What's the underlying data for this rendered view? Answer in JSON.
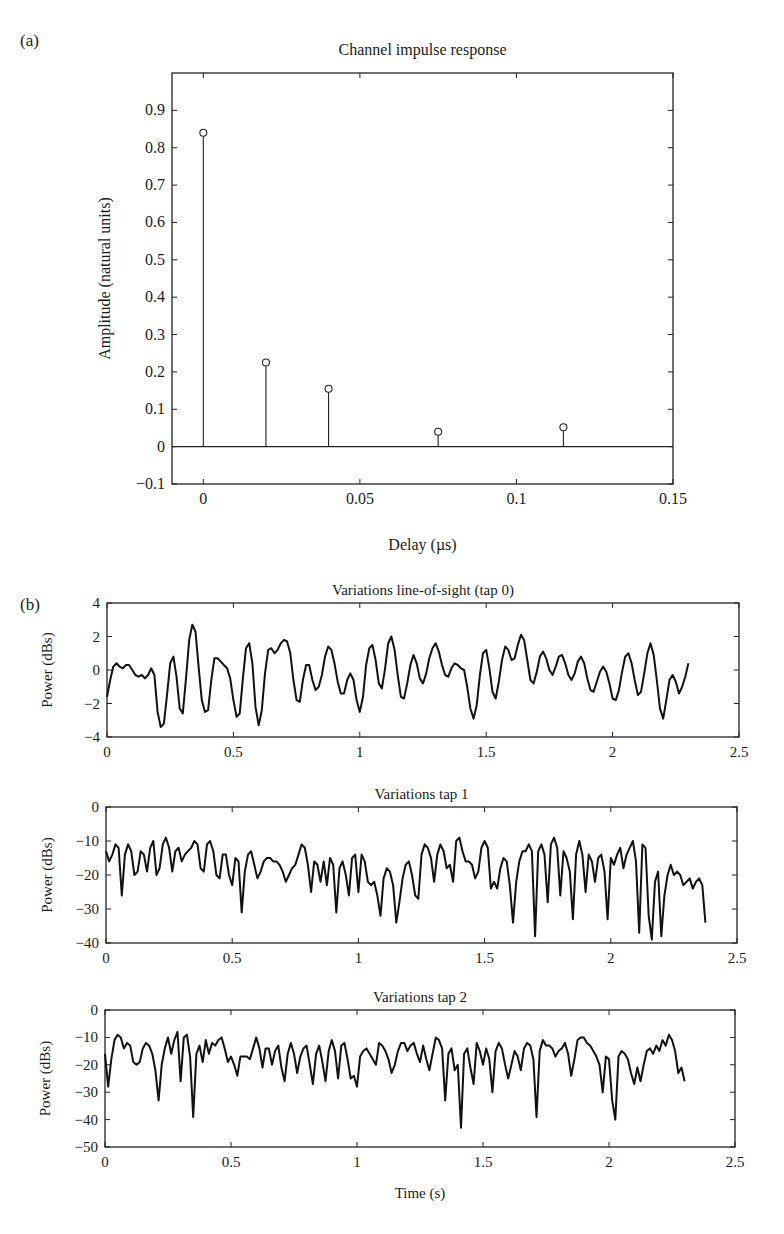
{
  "figure": {
    "panel_a_label": "(a)",
    "panel_b_label": "(b)"
  },
  "chart_data": [
    {
      "id": "a",
      "type": "stem",
      "title": "Channel impulse response",
      "xlabel": "Delay (µs)",
      "ylabel": "Amplitude (natural units)",
      "xlim": [
        -0.01,
        0.15
      ],
      "ylim": [
        -0.1,
        1.0
      ],
      "xticks": [
        0,
        0.05,
        0.1,
        0.15
      ],
      "xtick_labels": [
        "0",
        "0.05",
        "0.1",
        "0.15"
      ],
      "yticks": [
        -0.1,
        0,
        0.1,
        0.2,
        0.3,
        0.4,
        0.5,
        0.6,
        0.7,
        0.8,
        0.9
      ],
      "ytick_labels": [
        "−0.1",
        "0",
        "0.1",
        "0.2",
        "0.3",
        "0.4",
        "0.5",
        "0.6",
        "0.7",
        "0.8",
        "0.9"
      ],
      "x": [
        0,
        0.02,
        0.04,
        0.075,
        0.115
      ],
      "values": [
        0.84,
        0.225,
        0.155,
        0.04,
        0.052
      ],
      "grid": false,
      "zero_line": true
    },
    {
      "id": "b1",
      "type": "line",
      "title": "Variations line-of-sight (tap 0)",
      "xlabel": "",
      "ylabel": "Power (dBs)",
      "xlim": [
        0,
        2.5
      ],
      "ylim": [
        -4,
        4
      ],
      "xticks": [
        0,
        0.5,
        1,
        1.5,
        2,
        2.5
      ],
      "xtick_labels": [
        "0",
        "0.5",
        "1",
        "1.5",
        "2",
        "2.5"
      ],
      "yticks": [
        -4,
        -2,
        0,
        2,
        4
      ],
      "ytick_labels": [
        "−4",
        "−2",
        "0",
        "2",
        "4"
      ],
      "grid": false,
      "x_step": 0.0125,
      "values": [
        -1.6,
        -0.6,
        0.2,
        0.4,
        0.2,
        0.1,
        0.3,
        0.3,
        0.0,
        -0.3,
        -0.4,
        -0.3,
        -0.5,
        -0.3,
        0.1,
        -0.3,
        -2.5,
        -3.4,
        -3.2,
        -1.5,
        0.4,
        0.8,
        -0.4,
        -2.3,
        -2.6,
        -0.5,
        1.8,
        2.7,
        2.3,
        0.2,
        -1.8,
        -2.5,
        -2.4,
        -0.6,
        0.7,
        0.7,
        0.5,
        0.3,
        0.1,
        -0.5,
        -1.8,
        -2.8,
        -2.6,
        -0.5,
        1.3,
        1.6,
        0.4,
        -2.2,
        -3.3,
        -2.4,
        -0.2,
        1.2,
        1.3,
        1.0,
        1.2,
        1.6,
        1.8,
        1.7,
        1.0,
        -0.6,
        -1.8,
        -1.9,
        -0.6,
        0.3,
        0.3,
        -0.6,
        -1.2,
        -1.0,
        -0.3,
        0.8,
        1.4,
        1.2,
        0.4,
        -0.7,
        -1.4,
        -1.4,
        -0.6,
        -0.2,
        -0.6,
        -1.8,
        -2.5,
        -1.6,
        0.3,
        1.3,
        1.5,
        0.6,
        -0.8,
        -1.1,
        0.1,
        1.6,
        2.0,
        1.2,
        -0.3,
        -1.6,
        -1.7,
        -0.8,
        0.3,
        0.9,
        0.4,
        -0.5,
        -0.8,
        -0.2,
        0.7,
        1.3,
        1.6,
        1.1,
        0.3,
        -0.3,
        -0.4,
        0.1,
        0.4,
        0.3,
        0.1,
        0.0,
        -1.0,
        -2.3,
        -2.9,
        -2.1,
        -0.3,
        1.0,
        1.2,
        0.1,
        -1.3,
        -1.7,
        -0.7,
        0.6,
        1.4,
        1.2,
        0.6,
        0.7,
        1.5,
        2.1,
        1.8,
        0.6,
        -0.6,
        -0.8,
        -0.1,
        0.8,
        1.1,
        0.7,
        0.0,
        -0.3,
        0.2,
        0.8,
        0.9,
        0.4,
        -0.3,
        -0.6,
        -0.2,
        0.5,
        0.8,
        0.4,
        -0.5,
        -1.2,
        -1.3,
        -0.7,
        -0.1,
        0.2,
        -0.1,
        -0.8,
        -1.7,
        -1.8,
        -1.2,
        -0.1,
        0.8,
        1.0,
        0.4,
        -0.6,
        -1.5,
        -1.3,
        -0.2,
        1.0,
        1.6,
        0.9,
        -0.6,
        -2.3,
        -2.9,
        -1.8,
        -0.6,
        -0.3,
        -0.7,
        -1.4,
        -1.0,
        -0.4,
        0.4
      ]
    },
    {
      "id": "b2",
      "type": "line",
      "title": "Variations tap 1",
      "xlabel": "",
      "ylabel": "Power (dBs)",
      "xlim": [
        0,
        2.5
      ],
      "ylim": [
        -40,
        0
      ],
      "xticks": [
        0,
        0.5,
        1,
        1.5,
        2,
        2.5
      ],
      "xtick_labels": [
        "0",
        "0.5",
        "1",
        "1.5",
        "2",
        "2.5"
      ],
      "yticks": [
        -40,
        -30,
        -20,
        -10,
        0
      ],
      "ytick_labels": [
        "−40",
        "−30",
        "−20",
        "−10",
        "0"
      ],
      "grid": false,
      "x_step": 0.0125,
      "values": [
        -13,
        -16,
        -14,
        -11,
        -12,
        -26,
        -14,
        -11,
        -13,
        -20,
        -19,
        -13,
        -14,
        -19,
        -12,
        -10,
        -20,
        -18,
        -11,
        -9,
        -12,
        -19,
        -13,
        -12,
        -16,
        -14,
        -13,
        -12,
        -10,
        -11,
        -18,
        -19,
        -11,
        -10,
        -13,
        -20,
        -21,
        -14,
        -14,
        -20,
        -23,
        -15,
        -16,
        -31,
        -19,
        -14,
        -13,
        -17,
        -21,
        -19,
        -16,
        -15,
        -15,
        -16,
        -16,
        -17,
        -19,
        -22,
        -20,
        -18,
        -17,
        -14,
        -11,
        -12,
        -17,
        -25,
        -16,
        -17,
        -22,
        -16,
        -23,
        -15,
        -17,
        -31,
        -18,
        -16,
        -20,
        -26,
        -15,
        -14,
        -25,
        -14,
        -16,
        -22,
        -23,
        -22,
        -26,
        -32,
        -21,
        -18,
        -19,
        -23,
        -34,
        -28,
        -21,
        -17,
        -16,
        -20,
        -26,
        -27,
        -14,
        -11,
        -12,
        -15,
        -22,
        -14,
        -11,
        -13,
        -18,
        -17,
        -22,
        -10,
        -9,
        -13,
        -16,
        -16,
        -17,
        -21,
        -19,
        -12,
        -10,
        -12,
        -24,
        -22,
        -24,
        -18,
        -15,
        -16,
        -23,
        -34,
        -22,
        -16,
        -13,
        -13,
        -11,
        -13,
        -38,
        -13,
        -11,
        -14,
        -28,
        -11,
        -9,
        -12,
        -26,
        -13,
        -15,
        -19,
        -33,
        -14,
        -10,
        -14,
        -25,
        -14,
        -16,
        -22,
        -15,
        -14,
        -19,
        -33,
        -15,
        -17,
        -14,
        -12,
        -18,
        -14,
        -12,
        -10,
        -16,
        -37,
        -11,
        -12,
        -32,
        -39,
        -22,
        -19,
        -38,
        -26,
        -20,
        -17,
        -20,
        -19,
        -20,
        -23,
        -22,
        -21,
        -24,
        -22,
        -21,
        -23,
        -34
      ]
    },
    {
      "id": "b3",
      "type": "line",
      "title": "Variations tap 2",
      "xlabel": "Time (s)",
      "ylabel": "Power (dBs)",
      "xlim": [
        0,
        2.5
      ],
      "ylim": [
        -50,
        0
      ],
      "xticks": [
        0,
        0.5,
        1,
        1.5,
        2,
        2.5
      ],
      "xtick_labels": [
        "0",
        "0.5",
        "1",
        "1.5",
        "2",
        "2.5"
      ],
      "yticks": [
        -50,
        -40,
        -30,
        -20,
        -10,
        0
      ],
      "ytick_labels": [
        "−50",
        "−40",
        "−30",
        "−20",
        "−10",
        "0"
      ],
      "grid": false,
      "x_step": 0.0125,
      "values": [
        -16,
        -28,
        -18,
        -11,
        -9,
        -10,
        -14,
        -12,
        -13,
        -19,
        -20,
        -19,
        -14,
        -12,
        -13,
        -16,
        -22,
        -33,
        -20,
        -14,
        -10,
        -16,
        -11,
        -8,
        -26,
        -10,
        -9,
        -17,
        -39,
        -16,
        -13,
        -19,
        -11,
        -16,
        -12,
        -13,
        -11,
        -10,
        -14,
        -19,
        -17,
        -20,
        -24,
        -17,
        -17,
        -17,
        -18,
        -14,
        -10,
        -14,
        -21,
        -14,
        -14,
        -20,
        -15,
        -13,
        -21,
        -26,
        -16,
        -12,
        -16,
        -23,
        -17,
        -14,
        -13,
        -20,
        -27,
        -16,
        -13,
        -19,
        -26,
        -15,
        -11,
        -15,
        -25,
        -13,
        -12,
        -18,
        -25,
        -24,
        -28,
        -17,
        -15,
        -14,
        -16,
        -18,
        -20,
        -12,
        -13,
        -15,
        -18,
        -23,
        -20,
        -15,
        -12,
        -12,
        -15,
        -13,
        -12,
        -16,
        -19,
        -13,
        -18,
        -22,
        -16,
        -10,
        -11,
        -14,
        -33,
        -16,
        -14,
        -22,
        -20,
        -43,
        -16,
        -14,
        -21,
        -27,
        -12,
        -15,
        -20,
        -14,
        -18,
        -30,
        -15,
        -12,
        -14,
        -20,
        -25,
        -20,
        -15,
        -17,
        -22,
        -14,
        -12,
        -13,
        -18,
        -39,
        -15,
        -11,
        -13,
        -13,
        -14,
        -17,
        -15,
        -14,
        -12,
        -16,
        -24,
        -18,
        -11,
        -10,
        -10,
        -12,
        -13,
        -15,
        -17,
        -20,
        -30,
        -17,
        -18,
        -33,
        -40,
        -17,
        -15,
        -16,
        -18,
        -23,
        -27,
        -21,
        -26,
        -20,
        -15,
        -14,
        -16,
        -13,
        -15,
        -11,
        -13,
        -9,
        -11,
        -15,
        -23,
        -21,
        -26
      ]
    }
  ]
}
